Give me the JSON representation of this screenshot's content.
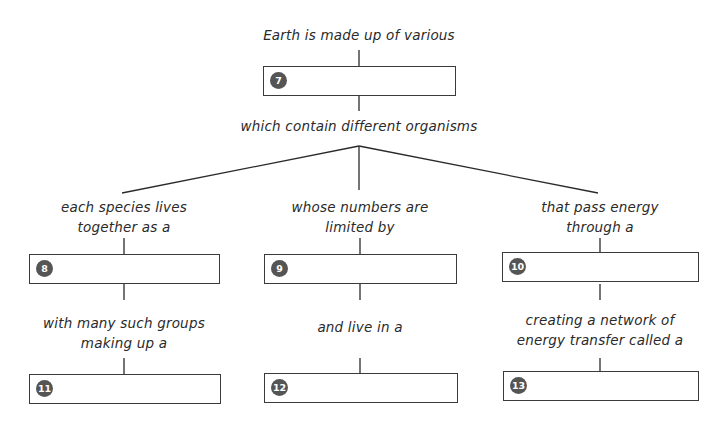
{
  "diagram": {
    "type": "concept-map",
    "root_label": "Earth is made up of various",
    "root_box": {
      "number": "7",
      "answer": ""
    },
    "mid_label": "which contain different organisms",
    "branches": [
      {
        "label_line1": "each species lives",
        "label_line2": "together as a",
        "box": {
          "number": "8",
          "answer": ""
        },
        "sub_label_line1": "with many such groups",
        "sub_label_line2": "making up a",
        "sub_box": {
          "number": "11",
          "answer": ""
        }
      },
      {
        "label_line1": "whose numbers are",
        "label_line2": "limited by",
        "box": {
          "number": "9",
          "answer": ""
        },
        "sub_label_line1": "and live in a",
        "sub_label_line2": "",
        "sub_box": {
          "number": "12",
          "answer": ""
        }
      },
      {
        "label_line1": "that pass energy",
        "label_line2": "through a",
        "box": {
          "number": "10",
          "answer": ""
        },
        "sub_label_line1": "creating a network of",
        "sub_label_line2": "energy transfer called a",
        "sub_box": {
          "number": "13",
          "answer": ""
        }
      }
    ],
    "colors": {
      "line": "#2a2a2a",
      "badge": "#555555",
      "box_border": "#3a3a3a"
    }
  }
}
